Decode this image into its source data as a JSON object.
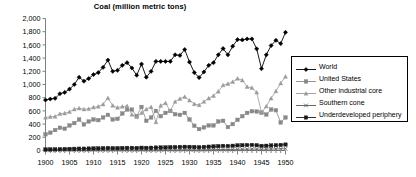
{
  "chart_data": {
    "type": "line",
    "title": "Coal (million metric tons)",
    "xlabel": "",
    "ylabel": "",
    "xlim": [
      1900,
      1950
    ],
    "ylim": [
      0,
      2000
    ],
    "ytick_step": 200,
    "xtick_step": 5,
    "grid": false,
    "legend_position": "right",
    "ytick_labels": [
      "0",
      "200",
      "400",
      "600",
      "800",
      "1,000",
      "1,200",
      "1,400",
      "1,600",
      "1,800",
      "2,000"
    ],
    "xtick_labels": [
      "1900",
      "1905",
      "1910",
      "1915",
      "1920",
      "1925",
      "1930",
      "1935",
      "1940",
      "1945",
      "1950"
    ],
    "x": [
      1900,
      1901,
      1902,
      1903,
      1904,
      1905,
      1906,
      1907,
      1908,
      1909,
      1910,
      1911,
      1912,
      1913,
      1914,
      1915,
      1916,
      1917,
      1918,
      1919,
      1920,
      1921,
      1922,
      1923,
      1924,
      1925,
      1926,
      1927,
      1928,
      1929,
      1930,
      1931,
      1932,
      1933,
      1934,
      1935,
      1936,
      1937,
      1938,
      1939,
      1940,
      1941,
      1942,
      1943,
      1944,
      1945,
      1946,
      1947,
      1948,
      1949,
      1950
    ],
    "series": [
      {
        "name": "World",
        "marker": "diamond",
        "color": "#000000",
        "values": [
          765,
          780,
          790,
          860,
          880,
          930,
          1000,
          1110,
          1050,
          1090,
          1150,
          1180,
          1260,
          1370,
          1200,
          1215,
          1290,
          1330,
          1250,
          1140,
          1310,
          1110,
          1200,
          1350,
          1350,
          1350,
          1350,
          1450,
          1440,
          1530,
          1340,
          1180,
          1105,
          1190,
          1290,
          1330,
          1450,
          1545,
          1450,
          1580,
          1680,
          1675,
          1690,
          1690,
          1540,
          1240,
          1450,
          1590,
          1670,
          1620,
          1790
        ]
      },
      {
        "name": "United States",
        "marker": "square",
        "color": "#888888",
        "values": [
          245,
          270,
          310,
          345,
          330,
          380,
          415,
          470,
          395,
          440,
          470,
          460,
          500,
          540,
          470,
          480,
          560,
          620,
          620,
          520,
          660,
          450,
          500,
          600,
          520,
          570,
          600,
          550,
          540,
          570,
          470,
          375,
          325,
          350,
          380,
          380,
          440,
          450,
          355,
          400,
          465,
          520,
          570,
          595,
          590,
          575,
          545,
          620,
          610,
          425,
          500
        ]
      },
      {
        "name": "Other industrial core",
        "marker": "triangle",
        "color": "#9a9a9a",
        "values": [
          500,
          510,
          515,
          555,
          565,
          585,
          625,
          640,
          625,
          630,
          655,
          665,
          700,
          795,
          680,
          650,
          665,
          675,
          545,
          510,
          570,
          625,
          660,
          430,
          680,
          720,
          600,
          740,
          785,
          815,
          760,
          705,
          690,
          740,
          790,
          830,
          895,
          990,
          1010,
          1040,
          1090,
          1065,
          965,
          950,
          880,
          575,
          670,
          790,
          900,
          1020,
          1120
        ]
      },
      {
        "name": "Southern cone",
        "marker": "x",
        "color": "#555555",
        "values": [
          4,
          4,
          5,
          5,
          5,
          6,
          6,
          7,
          7,
          7,
          8,
          8,
          9,
          9,
          9,
          8,
          9,
          9,
          9,
          8,
          9,
          8,
          9,
          10,
          10,
          11,
          11,
          12,
          12,
          13,
          12,
          11,
          11,
          12,
          13,
          14,
          15,
          16,
          15,
          16,
          18,
          19,
          20,
          21,
          21,
          18,
          20,
          22,
          24,
          25,
          27
        ]
      },
      {
        "name": "Underdeveloped periphery",
        "marker": "square-dark",
        "color": "#1a1a1a",
        "values": [
          16,
          17,
          18,
          20,
          22,
          24,
          26,
          28,
          28,
          30,
          32,
          33,
          35,
          38,
          36,
          36,
          38,
          40,
          40,
          38,
          42,
          40,
          42,
          45,
          46,
          48,
          50,
          52,
          54,
          56,
          55,
          52,
          50,
          54,
          58,
          62,
          66,
          70,
          68,
          72,
          78,
          80,
          82,
          84,
          80,
          70,
          72,
          76,
          80,
          84,
          90
        ]
      }
    ]
  },
  "legend": {
    "items": [
      {
        "label": "World"
      },
      {
        "label": "United States"
      },
      {
        "label": "Other industrial core"
      },
      {
        "label": "Southern cone"
      },
      {
        "label": "Underdeveloped periphery"
      }
    ]
  }
}
